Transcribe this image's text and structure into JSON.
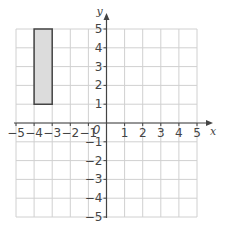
{
  "diagram": {
    "type": "coordinate-grid",
    "x_range": [
      -5,
      5
    ],
    "y_range": [
      -5,
      5
    ],
    "axis_labels": {
      "x": "x",
      "y": "y"
    },
    "origin_label": "0",
    "x_ticks": [
      "−5",
      "−4",
      "−3",
      "−2",
      "−1",
      "1",
      "2",
      "3",
      "4",
      "5"
    ],
    "x_tick_values": [
      -5,
      -4,
      -3,
      -2,
      -1,
      1,
      2,
      3,
      4,
      5
    ],
    "y_ticks": [
      "5",
      "4",
      "3",
      "2",
      "1",
      "−1",
      "−2",
      "−3",
      "−4",
      "−5"
    ],
    "y_tick_values": [
      5,
      4,
      3,
      2,
      1,
      -1,
      -2,
      -3,
      -4,
      -5
    ],
    "shapes": [
      {
        "name": "rectangle",
        "vertices": [
          [
            -4,
            1
          ],
          [
            -3,
            1
          ],
          [
            -3,
            5
          ],
          [
            -4,
            5
          ]
        ],
        "fill": "#dcdcdc",
        "stroke": "#444444"
      }
    ],
    "colors": {
      "grid": "#d0d0d0",
      "axis": "#444444",
      "text": "#444444"
    }
  }
}
